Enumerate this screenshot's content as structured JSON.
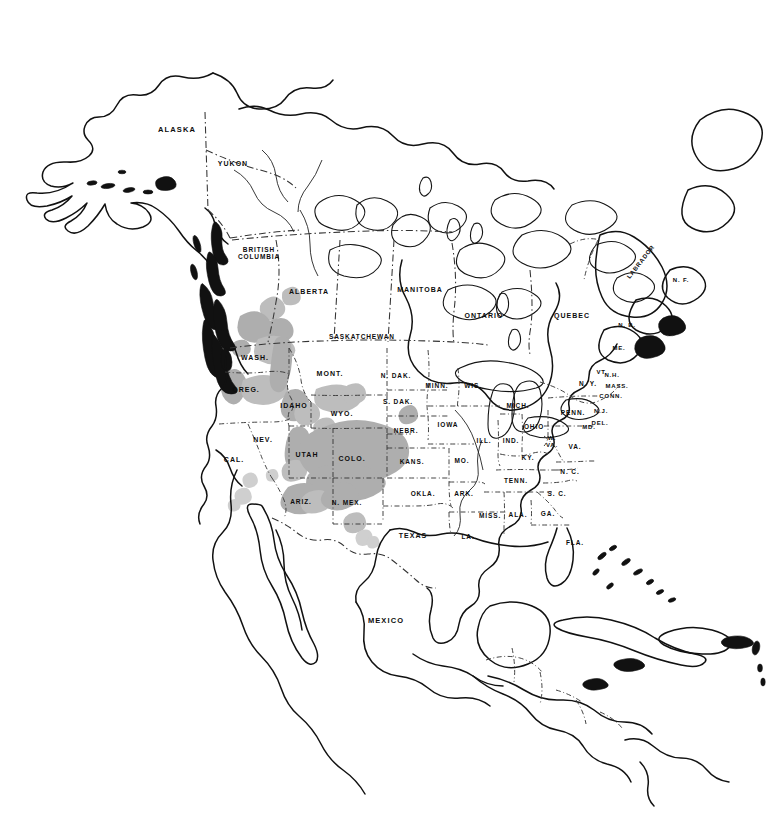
{
  "map": {
    "kind": "north-america-species-range-map",
    "title": "North America outline map with shaded distribution range",
    "background_color": "#ffffff",
    "outline_color": "#111111",
    "border_style": "dash-dot",
    "range_fill_color": "#aeaeae",
    "range_fill_color_soft": "#bdbdbd",
    "range_fill_color_faint": "#cfcfcf",
    "range_description": "Shaded gray areas concentrated in the western mountain regions of North America: southern British Columbia, Washington Cascades, Oregon, Idaho, western Montana, Wyoming, Utah, Colorado, Arizona and New Mexico."
  },
  "labels": [
    {
      "id": "alaska",
      "text": "ALASKA",
      "x": 177,
      "y": 130,
      "size": "s75",
      "rotated": false
    },
    {
      "id": "yukon",
      "text": "YUKON",
      "x": 233,
      "y": 164,
      "size": "s7",
      "rotated": false
    },
    {
      "id": "british-columbia",
      "text": "BRITISH\nCOLUMBIA",
      "x": 259,
      "y": 253,
      "size": "s65",
      "rotated": false
    },
    {
      "id": "alberta",
      "text": "ALBERTA",
      "x": 309,
      "y": 292,
      "size": "s7",
      "rotated": false
    },
    {
      "id": "saskatchewan",
      "text": "SASKATCHEWAN",
      "x": 362,
      "y": 337,
      "size": "s65",
      "rotated": false
    },
    {
      "id": "manitoba",
      "text": "MANITOBA",
      "x": 420,
      "y": 290,
      "size": "s7",
      "rotated": false
    },
    {
      "id": "ontario",
      "text": "ONTARIO",
      "x": 484,
      "y": 316,
      "size": "s7",
      "rotated": false
    },
    {
      "id": "quebec",
      "text": "QUEBEC",
      "x": 572,
      "y": 316,
      "size": "s7",
      "rotated": false
    },
    {
      "id": "labrador",
      "text": "LABRADOR",
      "x": 641,
      "y": 262,
      "size": "s6",
      "rotated": true
    },
    {
      "id": "newfoundland",
      "text": "N. F.",
      "x": 681,
      "y": 280,
      "size": "s6",
      "rotated": false
    },
    {
      "id": "new-brunswick",
      "text": "N. B.",
      "x": 627,
      "y": 325,
      "size": "s6",
      "rotated": false
    },
    {
      "id": "maine",
      "text": "ME.",
      "x": 619,
      "y": 348,
      "size": "s6",
      "rotated": false
    },
    {
      "id": "vermont",
      "text": "VT.",
      "x": 602,
      "y": 372,
      "size": "s6",
      "rotated": false
    },
    {
      "id": "new-hampshire",
      "text": "N.H.",
      "x": 612,
      "y": 375,
      "size": "s6",
      "rotated": false
    },
    {
      "id": "new-york",
      "text": "N. Y.",
      "x": 588,
      "y": 384,
      "size": "s65",
      "rotated": false
    },
    {
      "id": "massachusetts",
      "text": "MASS.",
      "x": 617,
      "y": 386,
      "size": "s6",
      "rotated": false
    },
    {
      "id": "connecticut",
      "text": "CONN.",
      "x": 611,
      "y": 396,
      "size": "s6",
      "rotated": false
    },
    {
      "id": "pennsylvania",
      "text": "PENN.",
      "x": 573,
      "y": 413,
      "size": "s65",
      "rotated": false
    },
    {
      "id": "new-jersey",
      "text": "N.J.",
      "x": 601,
      "y": 411,
      "size": "s6",
      "rotated": false
    },
    {
      "id": "maryland",
      "text": "MD.",
      "x": 589,
      "y": 427,
      "size": "s6",
      "rotated": false
    },
    {
      "id": "delaware",
      "text": "DEL.",
      "x": 600,
      "y": 423,
      "size": "s6",
      "rotated": false
    },
    {
      "id": "ohio",
      "text": "OHIO",
      "x": 534,
      "y": 427,
      "size": "s65",
      "rotated": false
    },
    {
      "id": "michigan",
      "text": "MICH.",
      "x": 518,
      "y": 406,
      "size": "s65",
      "rotated": false
    },
    {
      "id": "wisconsin",
      "text": "WIS.",
      "x": 473,
      "y": 386,
      "size": "s65",
      "rotated": false
    },
    {
      "id": "minnesota",
      "text": "MINN.",
      "x": 437,
      "y": 386,
      "size": "s65",
      "rotated": false
    },
    {
      "id": "iowa",
      "text": "IOWA",
      "x": 448,
      "y": 425,
      "size": "s65",
      "rotated": false
    },
    {
      "id": "illinois",
      "text": "ILL.",
      "x": 484,
      "y": 441,
      "size": "s65",
      "rotated": false
    },
    {
      "id": "indiana",
      "text": "IND.",
      "x": 511,
      "y": 441,
      "size": "s65",
      "rotated": false
    },
    {
      "id": "west-virginia",
      "text": "W.\nVA.",
      "x": 552,
      "y": 442,
      "size": "s6",
      "rotated": false
    },
    {
      "id": "virginia",
      "text": "VA.",
      "x": 575,
      "y": 447,
      "size": "s65",
      "rotated": false
    },
    {
      "id": "kentucky",
      "text": "KY.",
      "x": 528,
      "y": 458,
      "size": "s65",
      "rotated": false
    },
    {
      "id": "missouri",
      "text": "MO.",
      "x": 462,
      "y": 461,
      "size": "s65",
      "rotated": false
    },
    {
      "id": "nebraska",
      "text": "NEBR.",
      "x": 406,
      "y": 431,
      "size": "s65",
      "rotated": false
    },
    {
      "id": "north-dakota",
      "text": "N. DAK.",
      "x": 396,
      "y": 376,
      "size": "s65",
      "rotated": false
    },
    {
      "id": "south-dakota",
      "text": "S. DAK.",
      "x": 398,
      "y": 402,
      "size": "s65",
      "rotated": false
    },
    {
      "id": "kansas",
      "text": "KANS.",
      "x": 412,
      "y": 462,
      "size": "s65",
      "rotated": false
    },
    {
      "id": "oklahoma",
      "text": "OKLA.",
      "x": 423,
      "y": 494,
      "size": "s65",
      "rotated": false
    },
    {
      "id": "arkansas",
      "text": "ARK.",
      "x": 464,
      "y": 494,
      "size": "s65",
      "rotated": false
    },
    {
      "id": "tennessee",
      "text": "TENN.",
      "x": 516,
      "y": 481,
      "size": "s65",
      "rotated": false
    },
    {
      "id": "north-carolina",
      "text": "N. C.",
      "x": 570,
      "y": 472,
      "size": "s65",
      "rotated": false
    },
    {
      "id": "south-carolina",
      "text": "S. C.",
      "x": 557,
      "y": 494,
      "size": "s65",
      "rotated": false
    },
    {
      "id": "georgia",
      "text": "GA.",
      "x": 548,
      "y": 514,
      "size": "s65",
      "rotated": false
    },
    {
      "id": "alabama",
      "text": "ALA.",
      "x": 518,
      "y": 515,
      "size": "s65",
      "rotated": false
    },
    {
      "id": "mississippi",
      "text": "MISS.",
      "x": 490,
      "y": 516,
      "size": "s65",
      "rotated": false
    },
    {
      "id": "louisiana",
      "text": "LA.",
      "x": 468,
      "y": 537,
      "size": "s65",
      "rotated": false
    },
    {
      "id": "florida",
      "text": "FLA.",
      "x": 575,
      "y": 543,
      "size": "s65",
      "rotated": false
    },
    {
      "id": "texas",
      "text": "TEXAS",
      "x": 413,
      "y": 536,
      "size": "s7",
      "rotated": false
    },
    {
      "id": "new-mexico",
      "text": "N. MEX.",
      "x": 347,
      "y": 503,
      "size": "s65",
      "rotated": false
    },
    {
      "id": "arizona",
      "text": "ARIZ.",
      "x": 301,
      "y": 502,
      "size": "s65",
      "rotated": false
    },
    {
      "id": "colorado",
      "text": "COLO.",
      "x": 352,
      "y": 459,
      "size": "s7",
      "rotated": false
    },
    {
      "id": "utah",
      "text": "UTAH",
      "x": 307,
      "y": 455,
      "size": "s7",
      "rotated": false
    },
    {
      "id": "nevada",
      "text": "NEV.",
      "x": 263,
      "y": 440,
      "size": "s7",
      "rotated": false
    },
    {
      "id": "california",
      "text": "CAL.",
      "x": 234,
      "y": 460,
      "size": "s7",
      "rotated": false
    },
    {
      "id": "wyoming",
      "text": "WYO.",
      "x": 342,
      "y": 414,
      "size": "s7",
      "rotated": false
    },
    {
      "id": "idaho",
      "text": "IDAHO",
      "x": 294,
      "y": 406,
      "size": "s7",
      "rotated": false
    },
    {
      "id": "montana",
      "text": "MONT.",
      "x": 330,
      "y": 374,
      "size": "s7",
      "rotated": false
    },
    {
      "id": "oregon",
      "text": "OREG.",
      "x": 246,
      "y": 390,
      "size": "s7",
      "rotated": false
    },
    {
      "id": "washington",
      "text": "WASH.",
      "x": 255,
      "y": 358,
      "size": "s7",
      "rotated": false
    },
    {
      "id": "mexico",
      "text": "MEXICO",
      "x": 386,
      "y": 621,
      "size": "s75",
      "rotated": false
    }
  ]
}
